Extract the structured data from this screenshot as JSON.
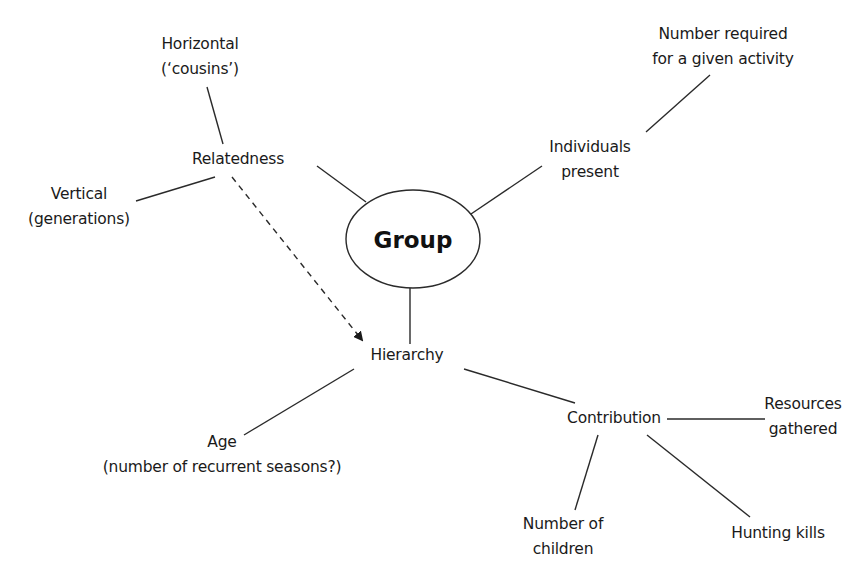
{
  "diagram": {
    "type": "concept-map",
    "center": {
      "label": "Group"
    },
    "nodes": {
      "horizontal": {
        "line1": "Horizontal",
        "line2": "(‘cousins’)"
      },
      "relatedness": {
        "line1": "Relatedness"
      },
      "vertical": {
        "line1": "Vertical",
        "line2": "(generations)"
      },
      "number_required": {
        "line1": "Number required",
        "line2": "for a given activity"
      },
      "individuals_present": {
        "line1": "Individuals",
        "line2": "present"
      },
      "hierarchy": {
        "line1": "Hierarchy"
      },
      "age": {
        "line1": "Age",
        "line2": "(number of recurrent seasons?)"
      },
      "contribution": {
        "line1": "Contribution"
      },
      "resources_gathered": {
        "line1": "Resources",
        "line2": "gathered"
      },
      "number_of_children": {
        "line1": "Number of",
        "line2": "children"
      },
      "hunting_kills": {
        "line1": "Hunting kills"
      }
    },
    "edges": [
      {
        "from": "Group",
        "to": "Relatedness",
        "style": "solid"
      },
      {
        "from": "Group",
        "to": "Individuals present",
        "style": "solid"
      },
      {
        "from": "Group",
        "to": "Hierarchy",
        "style": "solid"
      },
      {
        "from": "Relatedness",
        "to": "Horizontal ('cousins')",
        "style": "solid"
      },
      {
        "from": "Relatedness",
        "to": "Vertical (generations)",
        "style": "solid"
      },
      {
        "from": "Relatedness",
        "to": "Hierarchy",
        "style": "dashed-arrow"
      },
      {
        "from": "Individuals present",
        "to": "Number required for a given activity",
        "style": "solid"
      },
      {
        "from": "Hierarchy",
        "to": "Age (number of recurrent seasons?)",
        "style": "solid"
      },
      {
        "from": "Hierarchy",
        "to": "Contribution",
        "style": "solid"
      },
      {
        "from": "Contribution",
        "to": "Resources gathered",
        "style": "solid"
      },
      {
        "from": "Contribution",
        "to": "Number of children",
        "style": "solid"
      },
      {
        "from": "Contribution",
        "to": "Hunting kills",
        "style": "solid"
      }
    ],
    "colors": {
      "line": "#2a2a2a",
      "text": "#1a1a1a",
      "background": "#ffffff"
    }
  }
}
